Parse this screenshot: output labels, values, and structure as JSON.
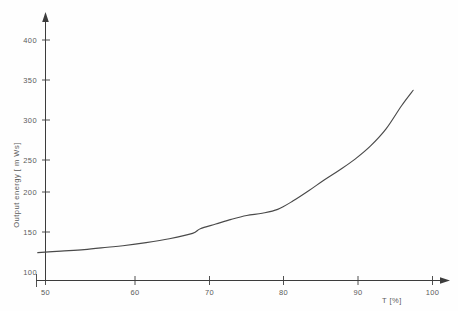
{
  "chart_data": {
    "type": "line",
    "title": "",
    "subtitle": "",
    "xlabel": "T [%]",
    "ylabel": "Output energy  [ m Ws]",
    "xlim": [
      47,
      102
    ],
    "ylim": [
      85,
      420
    ],
    "xticks": [
      50,
      60,
      70,
      80,
      90,
      100
    ],
    "yticks": [
      100,
      150,
      200,
      250,
      300,
      350,
      400
    ],
    "xtick_labels": [
      "50",
      "60",
      "70",
      "80",
      "90",
      "100"
    ],
    "ytick_labels": [
      "100",
      "150",
      "200",
      "250",
      "300",
      "350",
      "400"
    ],
    "grid": false,
    "legend": null,
    "legend_position": "none",
    "annotations": [],
    "series": [
      {
        "name": "Output energy vs T",
        "x": [
          49,
          52,
          55,
          58,
          60,
          63,
          66,
          69,
          70,
          72,
          74,
          76,
          78,
          80,
          82,
          84,
          86,
          88,
          90,
          92,
          94,
          96,
          97.5
        ],
        "values": [
          125,
          127,
          129,
          132,
          134,
          138,
          143,
          150,
          156,
          162,
          168,
          173,
          176,
          181,
          192,
          205,
          219,
          232,
          246,
          263,
          285,
          315,
          335
        ]
      }
    ]
  },
  "axes": {
    "y_axis_title": "Output energy  [ m Ws]",
    "x_axis_title": "T [%]",
    "y_ticks": [
      {
        "label": "400",
        "value": 400
      },
      {
        "label": "350",
        "value": 350
      },
      {
        "label": "300",
        "value": 300
      },
      {
        "label": "250",
        "value": 250
      },
      {
        "label": "200",
        "value": 200
      },
      {
        "label": "150",
        "value": 150
      },
      {
        "label": "100",
        "value": 100
      }
    ],
    "x_ticks": [
      {
        "label": "50",
        "value": 50
      },
      {
        "label": "60",
        "value": 60
      },
      {
        "label": "70",
        "value": 70
      },
      {
        "label": "80",
        "value": 80
      },
      {
        "label": "90",
        "value": 90
      },
      {
        "label": "100",
        "value": 100
      }
    ]
  },
  "colors": {
    "background": "#fefefe",
    "axis": "#3c3c3c",
    "curve": "#4a4a4a",
    "text": "#5b5b5b"
  }
}
